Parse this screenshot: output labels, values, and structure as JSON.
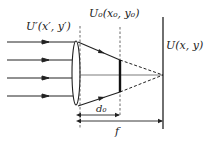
{
  "diagram": {
    "type": "optics-lens-diagram",
    "labels": {
      "input_field": "U′(x′, y′)",
      "object_plane": "U₀(x₀, y₀)",
      "output_field": "U(x, y)",
      "d0": "d₀",
      "focal_length": "f"
    },
    "colors": {
      "line": "#222222",
      "background": "#ffffff"
    },
    "incident_rays": 4
  }
}
